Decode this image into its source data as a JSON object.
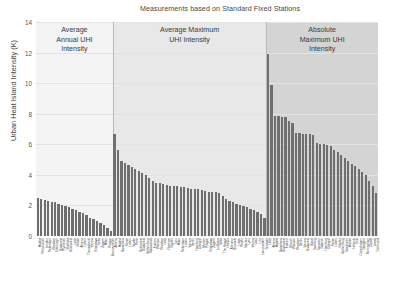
{
  "chart_data": {
    "type": "bar",
    "title": "Measurements based on Standard Fixed Stations",
    "xlabel": "",
    "ylabel": "Urban Heat Island Intensity (K)",
    "ylim": [
      0,
      14
    ],
    "yticks": [
      0,
      2,
      4,
      6,
      8,
      10,
      12,
      14
    ],
    "grid": true,
    "legend": "none",
    "sections": [
      {
        "label": "Average\nAnnual UHI\nIntensity",
        "label_lines": [
          "Average",
          "Annual UHI",
          "Intensity"
        ],
        "background": "#f4f4f4",
        "categories": [
          "Madrid",
          "Portsmouth",
          "London",
          "Rotterdam",
          "Wroclaw",
          "Edinburgh",
          "Budapest",
          "Plymouth",
          "Sheffield",
          "Bucharest",
          "Lodz",
          "Bilbao",
          "Athens",
          "Lisbon",
          "Thessaloniki",
          "Vienna",
          "Bratislava",
          "Sofia",
          "Zagreb",
          "Milan",
          "Prague",
          "Bournemouth"
        ],
        "values": [
          2.5,
          2.4,
          2.35,
          2.3,
          2.25,
          2.2,
          2.1,
          2.0,
          1.95,
          1.9,
          1.8,
          1.7,
          1.6,
          1.5,
          1.35,
          1.2,
          1.1,
          1.0,
          0.85,
          0.7,
          0.5,
          0.35
        ]
      },
      {
        "label": "Average  Maximum\nUHI Intensity",
        "label_lines": [
          "Average  Maximum",
          "UHI Intensity"
        ],
        "background": "#e8e8e8",
        "categories": [
          "Athens",
          "Madrid",
          "Barcelona",
          "Rome",
          "Lisbon",
          "Seville",
          "Porto",
          "Bucharest",
          "Budapest",
          "Gothenburg",
          "Salamanca",
          "Krakow",
          "Warsaw",
          "Wroclaw",
          "Lodz",
          "Florence",
          "Naples",
          "Turin",
          "Milan",
          "Rotterdam",
          "Lisbon",
          "Vienna",
          "Berlin",
          "Hamburg",
          "Cologne",
          "Munich",
          "Prague",
          "Bratislava",
          "Zagreb",
          "Ljubljana",
          "Sofia",
          "The Hague",
          "Utrecht",
          "Antwerp",
          "Brussels",
          "Liege",
          "Rouen",
          "Nantes",
          "Lyon",
          "Vienna",
          "Graz",
          "Linz",
          "Leeuwarden",
          "Stuttgart"
        ],
        "values": [
          6.7,
          5.6,
          4.9,
          4.75,
          4.65,
          4.5,
          4.4,
          4.25,
          4.1,
          4.0,
          3.8,
          3.6,
          3.5,
          3.45,
          3.4,
          3.35,
          3.3,
          3.3,
          3.25,
          3.2,
          3.2,
          3.15,
          3.1,
          3.1,
          3.05,
          3.0,
          2.95,
          2.9,
          2.9,
          2.85,
          2.8,
          2.6,
          2.4,
          2.3,
          2.2,
          2.1,
          2.0,
          1.95,
          1.9,
          1.8,
          1.7,
          1.6,
          1.45,
          1.2
        ]
      },
      {
        "label": "Absolute\nMaximum UHI\nIntensity",
        "label_lines": [
          "Absolute",
          "Maximum UHI",
          "Intensity"
        ],
        "background": "#d4d4d4",
        "categories": [
          "Lodz",
          "Athens",
          "Madrid",
          "Barcelona",
          "Bucharest",
          "Krakow",
          "Munich",
          "Warsaw",
          "Wroclaw",
          "Berlin",
          "Vienna",
          "Budapest",
          "Basel",
          "Salzburg",
          "Szczecin",
          "Gdansk",
          "Hamburg",
          "Cologne",
          "Rome",
          "Lisbon",
          "Naples",
          "Gothenburg",
          "Stockholm",
          "Malmo",
          "Helsinki",
          "Oslo",
          "Copenhagen",
          "Glasgow",
          "Birmingham",
          "Cardiff",
          "Leeds",
          "Dortmund"
        ],
        "values": [
          11.9,
          9.9,
          7.85,
          7.85,
          7.8,
          7.8,
          7.5,
          7.4,
          6.75,
          6.75,
          6.7,
          6.7,
          6.65,
          6.6,
          6.1,
          6.05,
          6.0,
          5.95,
          5.9,
          5.6,
          5.5,
          5.3,
          5.1,
          4.9,
          4.7,
          4.55,
          4.4,
          4.2,
          4.0,
          3.6,
          3.3,
          2.8
        ]
      }
    ]
  }
}
